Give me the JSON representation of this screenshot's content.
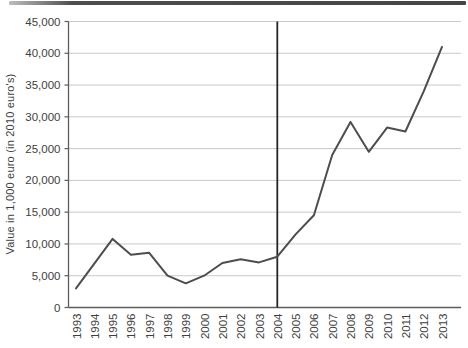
{
  "figure": {
    "top_rule_color": "#4a4a4a",
    "background": "#ffffff"
  },
  "chart_data": {
    "type": "line",
    "title": "",
    "xlabel": "",
    "ylabel": "Value in 1,000 euro (in 2010 euro's)",
    "x": [
      1993,
      1994,
      1995,
      1996,
      1997,
      1998,
      1999,
      2000,
      2001,
      2002,
      2003,
      2004,
      2005,
      2006,
      2007,
      2008,
      2009,
      2010,
      2011,
      2012,
      2013
    ],
    "series": [
      {
        "name": "value",
        "values": [
          3000,
          6900,
          10800,
          8300,
          8600,
          5000,
          3800,
          5000,
          7000,
          7600,
          7100,
          8000,
          11500,
          14500,
          24000,
          29200,
          24500,
          28300,
          27700,
          34000,
          41000
        ]
      }
    ],
    "ylim": [
      0,
      45000
    ],
    "yticks": [
      0,
      5000,
      10000,
      15000,
      20000,
      25000,
      30000,
      35000,
      40000,
      45000
    ],
    "ytick_labels": [
      "0",
      "5,000",
      "10,000",
      "15,000",
      "20,000",
      "25,000",
      "30,000",
      "35,000",
      "40,000",
      "45,000"
    ],
    "grid": true,
    "legend": "none",
    "annotations": [
      {
        "type": "vline",
        "x": 2004
      }
    ],
    "colors": {
      "line": "#4d4d4d",
      "grid": "#c9c9c9",
      "axis": "#5c5c5c",
      "vline": "#262626",
      "text": "#3e3e3e"
    }
  }
}
